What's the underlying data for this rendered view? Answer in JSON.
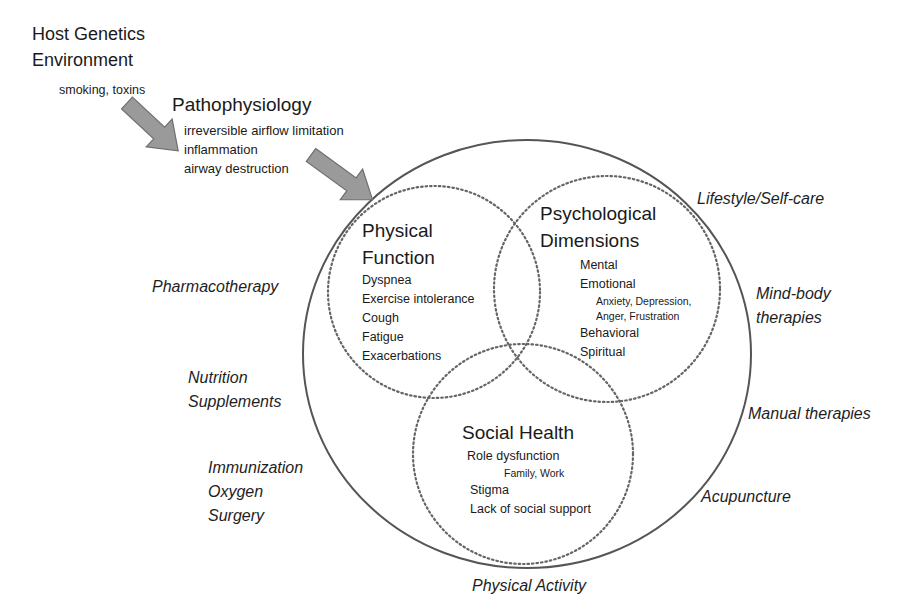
{
  "causes": {
    "host_genetics": "Host Genetics",
    "environment": "Environment",
    "environment_detail": "smoking, toxins"
  },
  "pathophysiology": {
    "title": "Pathophysiology",
    "items": [
      "irreversible airflow limitation",
      "inflammation",
      "airway destruction"
    ]
  },
  "domains": {
    "physical": {
      "title_line1": "Physical",
      "title_line2": "Function",
      "items": [
        "Dyspnea",
        "Exercise intolerance",
        "Cough",
        "Fatigue",
        "Exacerbations"
      ]
    },
    "psychological": {
      "title_line1": "Psychological",
      "title_line2": "Dimensions",
      "items": [
        "Mental",
        "Emotional"
      ],
      "emotional_detail": [
        "Anxiety, Depression,",
        "Anger, Frustration"
      ],
      "items_after": [
        "Behavioral",
        "Spiritual"
      ]
    },
    "social": {
      "title": "Social Health",
      "items": [
        "Role dysfunction"
      ],
      "role_detail": "Family, Work",
      "items_after": [
        "Stigma",
        "Lack of social support"
      ]
    }
  },
  "interventions": {
    "left": {
      "pharmacotherapy": "Pharmacotherapy",
      "nutrition": [
        "Nutrition",
        "Supplements"
      ],
      "medical": [
        "Immunization",
        "Oxygen",
        "Surgery"
      ]
    },
    "right": {
      "lifestyle": "Lifestyle/Self-care",
      "mind_body": [
        "Mind-body",
        "therapies"
      ],
      "manual": "Manual therapies",
      "acupuncture": "Acupuncture"
    },
    "bottom": {
      "physical_activity": "Physical Activity"
    }
  },
  "colors": {
    "outer_circle": "#555555",
    "dotted_circle": "#666666",
    "arrow_fill": "#9a9a9a",
    "arrow_stroke": "#6e6e6e",
    "text": "#1a1a1a"
  }
}
